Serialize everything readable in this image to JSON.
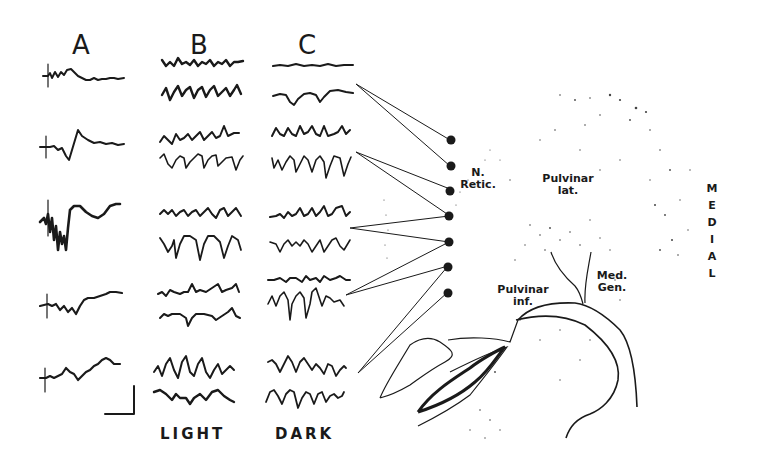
{
  "figure": {
    "column_labels": [
      "A",
      "B",
      "C"
    ],
    "condition_labels": {
      "B": "LIGHT",
      "C": "DARK"
    },
    "rows": 5,
    "traces_per_row": {
      "A": 1,
      "B": 2,
      "C": 2
    },
    "scale_bar": {
      "present": true,
      "units_shown": ""
    },
    "recording_sites": 7
  },
  "anatomy": {
    "labels": {
      "n_retic": "N.\nRetic.",
      "n_retic_line1": "N.",
      "n_retic_line2": "Retic.",
      "pulvinar_lat_line1": "Pulvinar",
      "pulvinar_lat_line2": "lat.",
      "pulvinar_inf_line1": "Pulvinar",
      "pulvinar_inf_line2": "inf.",
      "med_gen_line1": "Med.",
      "med_gen_line2": "Gen."
    },
    "orientation_label": "MEDIAL",
    "orientation_letters": [
      "M",
      "E",
      "D",
      "I",
      "A",
      "L"
    ]
  },
  "colors": {
    "ink": "#1a1a1a",
    "background": "#ffffff",
    "stipple": "#555555"
  }
}
